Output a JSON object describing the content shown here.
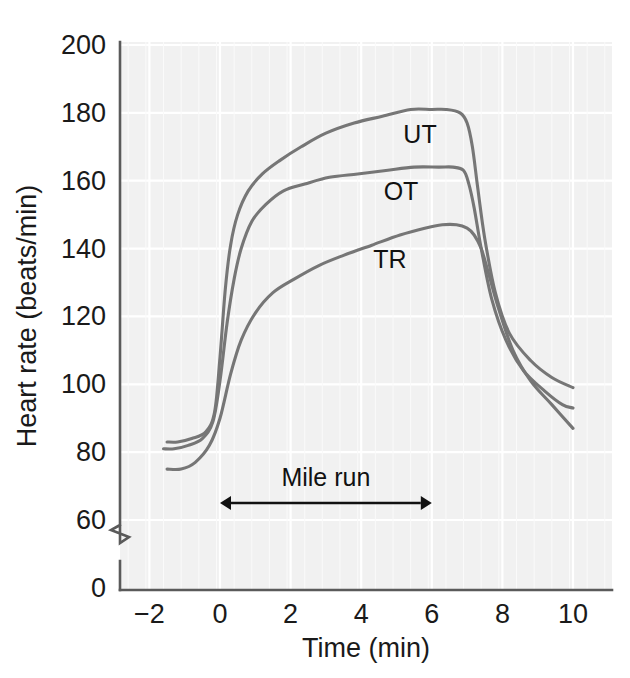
{
  "chart_data": {
    "type": "line",
    "title": "",
    "xlabel": "Time (min)",
    "ylabel": "Heart rate (beats/min)",
    "xlim": [
      -2.6,
      11.1
    ],
    "ylim": [
      56,
      202
    ],
    "y_axis_break": true,
    "y_axis_break_value": 0,
    "grid": true,
    "legend_position": "inline-curve-labels",
    "xticks": [
      "−2",
      "0",
      "2",
      "4",
      "6",
      "8",
      "10"
    ],
    "xtick_values": [
      -2,
      0,
      2,
      4,
      6,
      8,
      10
    ],
    "yticks": [
      "200",
      "180",
      "160",
      "140",
      "120",
      "100",
      "80",
      "60",
      "0"
    ],
    "ytick_values": [
      200,
      180,
      160,
      140,
      120,
      100,
      80,
      60,
      0
    ],
    "series": [
      {
        "name": "UT",
        "label": "UT",
        "color": "#767676",
        "x": [
          -1.5,
          -1.2,
          -0.8,
          -0.4,
          -0.15,
          0.0,
          0.15,
          0.3,
          0.5,
          0.8,
          1.2,
          1.7,
          2.3,
          3.0,
          3.8,
          4.6,
          5.4,
          6.0,
          6.4,
          6.8,
          7.0,
          7.15,
          7.3,
          7.5,
          7.8,
          8.2,
          8.8,
          9.4,
          10.0
        ],
        "y": [
          83,
          83,
          84,
          86,
          92,
          108,
          128,
          141,
          150,
          157,
          162,
          166,
          170,
          174,
          177,
          179,
          181,
          181,
          181,
          180,
          177,
          170,
          158,
          143,
          127,
          115,
          107,
          102,
          99
        ]
      },
      {
        "name": "OT",
        "label": "OT",
        "color": "#767676",
        "x": [
          -1.6,
          -1.3,
          -0.9,
          -0.5,
          -0.2,
          0.0,
          0.2,
          0.4,
          0.6,
          0.9,
          1.3,
          1.8,
          2.4,
          3.1,
          3.9,
          4.7,
          5.5,
          6.2,
          6.6,
          6.9,
          7.05,
          7.2,
          7.4,
          7.7,
          8.1,
          8.6,
          9.2,
          9.7,
          10.0
        ],
        "y": [
          81,
          81,
          82,
          84,
          89,
          101,
          118,
          131,
          140,
          148,
          153,
          157,
          159,
          161,
          162,
          163,
          164,
          164,
          164,
          163,
          159,
          152,
          140,
          125,
          113,
          104,
          98,
          94,
          93
        ]
      },
      {
        "name": "TR",
        "label": "TR",
        "color": "#767676",
        "x": [
          -1.5,
          -1.1,
          -0.7,
          -0.3,
          0.0,
          0.3,
          0.6,
          1.0,
          1.5,
          2.1,
          2.8,
          3.5,
          4.3,
          5.1,
          5.8,
          6.3,
          6.7,
          7.0,
          7.2,
          7.4,
          7.6,
          7.9,
          8.3,
          8.8,
          9.4,
          10.0
        ],
        "y": [
          75,
          75,
          77,
          82,
          90,
          103,
          113,
          121,
          127,
          131,
          135,
          138,
          141,
          144,
          146,
          147,
          147,
          146,
          144,
          140,
          133,
          122,
          110,
          101,
          94,
          87
        ]
      }
    ],
    "annotations": [
      {
        "name": "mile-run",
        "text": "Mile run",
        "x_start": 0,
        "x_end": 6,
        "y": 65,
        "style": "double-arrow"
      }
    ]
  },
  "axis": {
    "x_title": "Time (min)",
    "y_title": "Heart rate (beats/min)"
  },
  "colors": {
    "plot_background": "#f1f1f1",
    "gridline": "#ffffff",
    "curve": "#767676",
    "axis": "#5a5a5a",
    "text": "#1a1a1a"
  }
}
